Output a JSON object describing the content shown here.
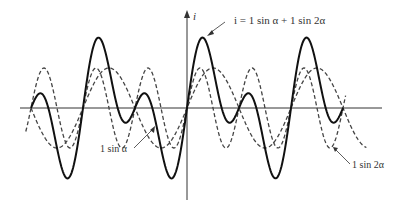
{
  "diagram": {
    "axis_label_y": "i",
    "equation_label": "i = 1 sin α + 1 sin 2α",
    "series": [
      {
        "name": "sum",
        "label": "i = 1 sin α + 1 sin 2α",
        "style": "solid",
        "amplitude": 1,
        "formula": "sin(a)+sin(2a)"
      },
      {
        "name": "fundamental",
        "label": "1 sin α",
        "style": "dashed",
        "amplitude": 1,
        "formula": "sin(a)"
      },
      {
        "name": "second-harmonic",
        "label": "1 sin 2α",
        "style": "dashed",
        "amplitude": 1,
        "formula": "sin(2a)"
      }
    ],
    "labels": {
      "sum": "i = 1 sin α + 1 sin 2α",
      "fundamental": "1 sin α",
      "harmonic": "1 sin 2α"
    },
    "colors": {
      "ink": "#1a1a1a",
      "dashed": "#444444",
      "background": "#ffffff"
    }
  }
}
